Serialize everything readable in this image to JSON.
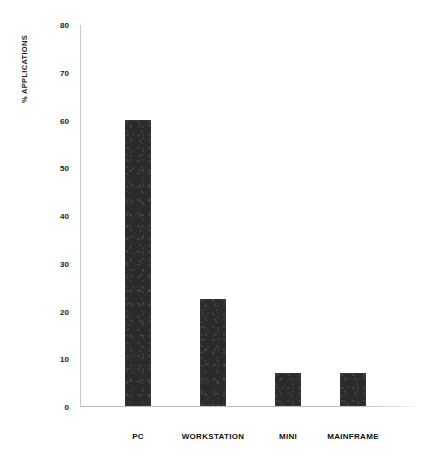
{
  "chart_data": {
    "type": "bar",
    "title": "",
    "subtitle": "",
    "xlabel": "",
    "ylabel": "% APPLICATIONS",
    "categories": [
      "PC",
      "WORKSTATION",
      "MINI",
      "MAINFRAME"
    ],
    "values": [
      60,
      22.5,
      7,
      7
    ],
    "ylim": [
      0,
      80
    ],
    "yticks": [
      0,
      10,
      20,
      30,
      40,
      50,
      60,
      70,
      80
    ],
    "ytick_labels": [
      "0",
      "10",
      "20",
      "30",
      "40",
      "50",
      "60",
      "70",
      "80"
    ],
    "grid": false,
    "legend": null,
    "bar_color": "#2b2b2b",
    "axis_color": "#c9c9c9",
    "background_color": "#ffffff",
    "annotations": []
  }
}
